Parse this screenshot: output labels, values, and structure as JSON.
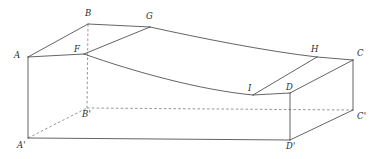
{
  "figure": {
    "type": "geometry-diagram",
    "width": 379,
    "height": 159,
    "background_color": "#ffffff",
    "line_color": "#3c3c3c",
    "hidden_line_color": "#6a6a6a",
    "label_color": "#2b2b2b"
  },
  "vertices": [
    {
      "id": "A",
      "label": "A",
      "x": 28,
      "y": 57,
      "label_x": 14,
      "label_y": 51,
      "hidden": false
    },
    {
      "id": "B",
      "label": "B",
      "x": 88,
      "y": 24,
      "label_x": 85,
      "label_y": 9,
      "hidden": false
    },
    {
      "id": "G",
      "label": "G",
      "x": 150,
      "y": 27,
      "label_x": 146,
      "label_y": 12,
      "hidden": false
    },
    {
      "id": "F",
      "label": "F",
      "x": 84,
      "y": 54,
      "label_x": 74,
      "label_y": 45,
      "hidden": false
    },
    {
      "id": "H",
      "label": "H",
      "x": 317,
      "y": 57,
      "label_x": 311,
      "label_y": 45,
      "hidden": false
    },
    {
      "id": "C",
      "label": "C",
      "x": 353,
      "y": 60,
      "label_x": 357,
      "label_y": 49,
      "hidden": false
    },
    {
      "id": "I",
      "label": "I",
      "x": 253,
      "y": 95,
      "label_x": 248,
      "label_y": 84,
      "hidden": false
    },
    {
      "id": "D",
      "label": "D",
      "x": 290,
      "y": 93,
      "label_x": 286,
      "label_y": 83,
      "hidden": false
    },
    {
      "id": "A_prime",
      "label": "A'",
      "x": 28,
      "y": 138,
      "label_x": 17,
      "label_y": 141,
      "hidden": false
    },
    {
      "id": "B_prime",
      "label": "B'",
      "x": 87,
      "y": 108,
      "label_x": 82,
      "label_y": 110,
      "hidden": true
    },
    {
      "id": "C_prime",
      "label": "C'",
      "x": 353,
      "y": 110,
      "label_x": 357,
      "label_y": 112,
      "hidden": false
    },
    {
      "id": "D_prime",
      "label": "D'",
      "x": 290,
      "y": 140,
      "label_x": 286,
      "label_y": 142,
      "hidden": false
    }
  ],
  "edges": {
    "solid": [
      {
        "name": "edge-A-B",
        "d": "M 28 57 L 88 24"
      },
      {
        "name": "edge-B-G",
        "d": "M 88 24 L 150 27"
      },
      {
        "name": "edge-A-F",
        "d": "M 28 57 L 84 54"
      },
      {
        "name": "edge-F-G",
        "d": "M 84 54 L 150 27"
      },
      {
        "name": "edge-A-Aprime",
        "d": "M 28 57 L 28 138"
      },
      {
        "name": "edge-Aprime-Dprime",
        "d": "M 28 138 L 290 140"
      },
      {
        "name": "edge-D-Dprime",
        "d": "M 290 93 L 290 140"
      },
      {
        "name": "edge-Dprime-Cprime",
        "d": "M 290 140 L 353 110"
      },
      {
        "name": "edge-C-Cprime",
        "d": "M 353 60 L 353 110"
      },
      {
        "name": "edge-D-C",
        "d": "M 290 93 L 353 60"
      },
      {
        "name": "edge-I-D",
        "d": "M 253 95 L 290 93"
      },
      {
        "name": "edge-I-H",
        "d": "M 253 95 L 317 57"
      },
      {
        "name": "edge-H-C",
        "d": "M 317 57 L 353 60"
      }
    ],
    "curved": [
      {
        "name": "curve-G-H-top",
        "d": "M 150 27 C 200 38, 265 51, 317 57"
      },
      {
        "name": "curve-F-I-bottom",
        "d": "M 84 54 C 135 72, 200 90, 253 95"
      }
    ],
    "hidden": [
      {
        "name": "edge-B-Bprime-hidden",
        "d": "M 88 24 L 87 108"
      },
      {
        "name": "edge-Aprime-Bprime-hidden",
        "d": "M 28 138 L 87 108"
      },
      {
        "name": "edge-Bprime-Cprime-hidden",
        "d": "M 87 108 L 353 110"
      }
    ]
  }
}
